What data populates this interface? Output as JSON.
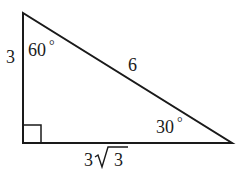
{
  "diagram": {
    "type": "right-triangle",
    "colors": {
      "stroke": "#1a1a1a",
      "background": "#ffffff"
    },
    "vertices": {
      "top": [
        23,
        13
      ],
      "right_angle": [
        23,
        143
      ],
      "bottom_right": [
        232,
        143
      ]
    },
    "labels": {
      "left_side": "3",
      "hypotenuse": "6",
      "bottom_side_coefficient": "3",
      "bottom_side_radical": "3",
      "bottom_side": "3√3",
      "top_angle": "60",
      "bottom_right_angle": "30",
      "degree_symbol": "°"
    },
    "right_angle_marker": true
  }
}
